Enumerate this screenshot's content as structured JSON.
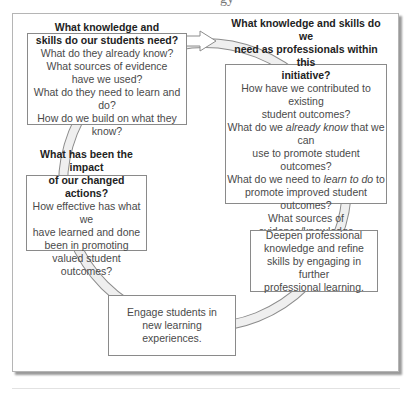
{
  "header_fragment": "gy",
  "cycle": {
    "boxes": [
      {
        "id": "student-needs",
        "title_lines": [
          "What knowledge and",
          "skills do our students need?"
        ],
        "lines": [
          "What do they already know?",
          "What sources of evidence",
          "have we used?",
          "What do they need to learn and do?",
          "How do we build on what they know?"
        ]
      },
      {
        "id": "professional-needs",
        "title_lines": [
          "What knowledge and skills do we",
          "need as professionals within this",
          "initiative?"
        ],
        "lines": [
          "How have we contributed to existing",
          "student outcomes?",
          "What do we already know that we can",
          "use to promote student outcomes?",
          "What do we need to learn to do to",
          "promote improved student outcomes?",
          "What sources of evidence/knowledge",
          "can we utilize?"
        ],
        "italic_phrases": [
          "already know",
          "learn to do"
        ]
      },
      {
        "id": "deepen-learning",
        "lines": [
          "Deepen professional",
          "knowledge and refine",
          "skills by engaging in further",
          "professional learning."
        ]
      },
      {
        "id": "engage-students",
        "lines": [
          "Engage students in",
          "new learning",
          "experiences."
        ]
      },
      {
        "id": "impact",
        "title_lines": [
          "What has been the impact",
          "of our changed actions?"
        ],
        "lines": [
          "How effective has what we",
          "have learned and done",
          "been in promoting",
          "valued student outcomes?"
        ]
      }
    ],
    "ring": {
      "center": [
        205,
        185
      ],
      "radius": 142,
      "band_width": 8,
      "fill": "#efefef",
      "stroke": "#8c8c8c"
    }
  }
}
